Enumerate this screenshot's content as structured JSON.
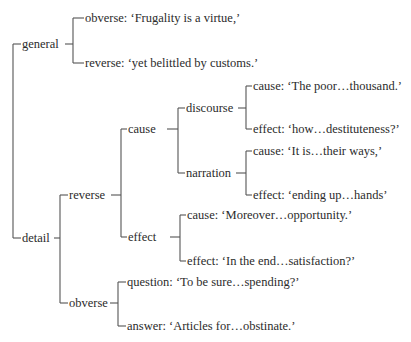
{
  "tree": {
    "root": {
      "general": {
        "label": "general",
        "obverse": "obverse: ‘Frugality is a virtue,’",
        "reverse": "reverse: ‘yet belittled by customs.’"
      },
      "detail": {
        "label": "detail",
        "reverse": {
          "label": "reverse",
          "cause": {
            "label": "cause",
            "discourse": {
              "label": "discourse",
              "cause": "cause: ‘The poor…thousand.’",
              "effect": "effect: ‘how…destituteness?’"
            },
            "narration": {
              "label": "narration",
              "cause": "cause: ‘It is…their ways,’",
              "effect": "effect: ‘ending up…hands’"
            }
          },
          "effect": {
            "label": "effect",
            "cause": "cause: ‘Moreover…opportunity.’",
            "effect": "effect: ‘In the end…satisfaction?’"
          }
        },
        "obverse": {
          "label": "obverse",
          "question": "question: ‘To be sure…spending?’",
          "answer": "answer: ‘Articles for…obstinate.’"
        }
      }
    }
  }
}
